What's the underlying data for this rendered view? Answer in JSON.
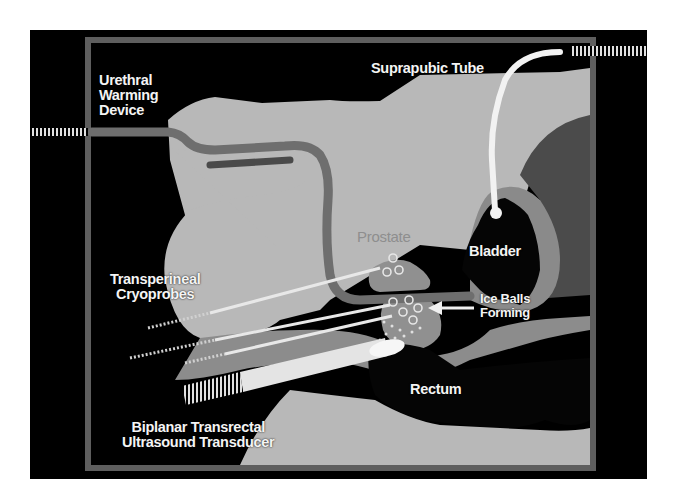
{
  "figure": {
    "colors": {
      "background": "#000000",
      "frame": "#5a5a5a",
      "tissue_light": "#b9b9b9",
      "tissue_mid": "#8a8a8a",
      "tissue_dark": "#4a4a4a",
      "urethra": "#6e6e6e",
      "label": "#f4f4f4",
      "instrument": "#e8e8e8"
    }
  },
  "labels": {
    "urethral_warming_device": [
      "Urethral",
      "Warming",
      "Device"
    ],
    "suprapubic_tube": "Suprapubic Tube",
    "prostate": "Prostate",
    "bladder": "Bladder",
    "transperineal_cryoprobes": [
      "Transperineal",
      "Cryoprobes"
    ],
    "ice_balls_forming": [
      "Ice Balls",
      "Forming"
    ],
    "rectum": "Rectum",
    "biplanar_transducer": [
      "Biplanar Transrectal",
      "Ultrasound Transducer"
    ]
  }
}
